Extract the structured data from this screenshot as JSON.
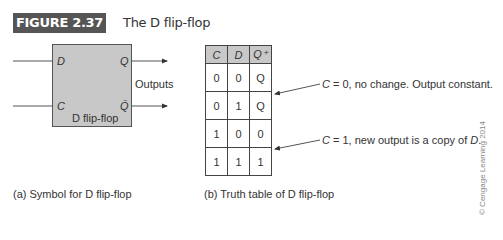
{
  "figure": {
    "label": "FIGURE 2.37",
    "title": "The D flip-flop",
    "label_bg_color": "#555555",
    "box_fill_color": "#c8c8c8"
  },
  "symbol": {
    "inputs": [
      "D",
      "C"
    ],
    "outputs": [
      "Q",
      "Q̄"
    ],
    "block_name": "D flip-flop",
    "outputs_label": "Outputs",
    "caption": "(a) Symbol for D flip-flop"
  },
  "truth_table": {
    "headers": [
      "C",
      "D",
      "Q⁺"
    ],
    "rows": [
      [
        "0",
        "0",
        "Q"
      ],
      [
        "0",
        "1",
        "Q"
      ],
      [
        "1",
        "0",
        "0"
      ],
      [
        "1",
        "1",
        "1"
      ]
    ],
    "caption": "(b) Truth table of D flip-flop"
  },
  "annotations": [
    {
      "prefix": "C",
      "text": " = 0, no change. Output constant."
    },
    {
      "prefix": "C",
      "text": " = 1, new output is a copy of ",
      "suffix_italic": "D",
      "end": "."
    }
  ],
  "copyright": "© Cengage Learning 2014"
}
